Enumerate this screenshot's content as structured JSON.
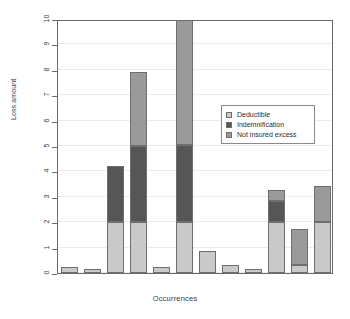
{
  "chart_data": {
    "type": "bar",
    "title": "",
    "subtitle": "",
    "xlabel": "Occurrences",
    "ylabel": "Loss amount",
    "ylim": [
      0,
      10
    ],
    "yticks": [
      0,
      1,
      2,
      3,
      4,
      5,
      6,
      7,
      8,
      9,
      10
    ],
    "ytick_labels": [
      "0",
      "1",
      "2",
      "3",
      "4",
      "5",
      "6",
      "7",
      "8",
      "9",
      "10"
    ],
    "xticks": [],
    "xtick_labels": [],
    "grid": "horizontal",
    "stacked": true,
    "legend_position": "center-right",
    "categories": [
      "1",
      "2",
      "3",
      "4",
      "5",
      "6",
      "7",
      "8",
      "9",
      "10",
      "11",
      "12"
    ],
    "series": [
      {
        "name": "Deductible",
        "color": "#c9c9c9",
        "values": [
          0.25,
          0.17,
          2.0,
          2.0,
          0.25,
          2.0,
          0.86,
          0.3,
          0.15,
          2.0,
          0.31,
          2.0
        ]
      },
      {
        "name": "Indemnification",
        "color": "#565656",
        "values": [
          0,
          0,
          2.2,
          3.0,
          0,
          3.05,
          0,
          0,
          0,
          0.85,
          0,
          0
        ]
      },
      {
        "name": "Not insured excess",
        "color": "#9a9a9a",
        "values": [
          0,
          0,
          0,
          2.9,
          0,
          5.0,
          0,
          0,
          0,
          0.4,
          1.42,
          1.42
        ]
      }
    ],
    "totals": [
      0.25,
      0.17,
      4.2,
      7.9,
      0.25,
      10.05,
      0.86,
      0.3,
      0.15,
      3.25,
      1.73,
      3.42
    ]
  },
  "legend": {
    "entries": [
      {
        "label": "Deductible",
        "color": "#c9c9c9"
      },
      {
        "label": "Indemnification",
        "color": "#565656"
      },
      {
        "label": "Not insured excess",
        "color": "#9a9a9a"
      }
    ]
  }
}
